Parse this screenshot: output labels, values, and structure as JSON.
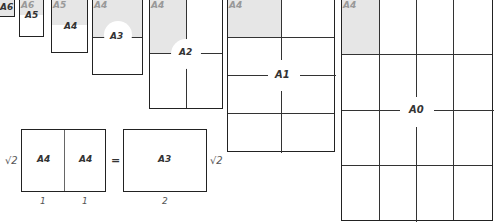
{
  "diagram": {
    "sheets": [
      {
        "name": "A6",
        "label": "A6"
      },
      {
        "name": "A5",
        "label": "A5",
        "corner": "A6"
      },
      {
        "name": "A4",
        "label": "A4",
        "corner": "A5"
      },
      {
        "name": "A3",
        "label": "A3",
        "corner": "A4"
      },
      {
        "name": "A2",
        "label": "A2",
        "corner": "A4"
      },
      {
        "name": "A1",
        "label": "A1",
        "corner": "A4"
      },
      {
        "name": "A0",
        "label": "A0",
        "corner": "A4"
      }
    ],
    "equation": {
      "left_label_1": "A4",
      "left_label_2": "A4",
      "equals": "=",
      "right_label": "A3",
      "height_left": "√2",
      "height_right": "√2",
      "width_1": "1",
      "width_2": "1",
      "width_total": "2"
    },
    "colors": {
      "shade": "#e6e6e6",
      "border": "#222222"
    }
  }
}
